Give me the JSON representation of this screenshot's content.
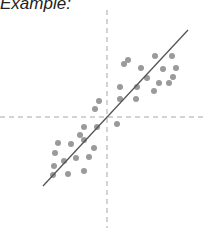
{
  "title": "Example:",
  "chart_data": {
    "type": "scatter",
    "title": "Example:",
    "xlabel": "",
    "ylabel": "",
    "grid": false,
    "legend": null,
    "axes": {
      "style": "dashed",
      "color": "#a6a6a6",
      "origin_px": [
        107,
        117
      ]
    },
    "xlim": [
      -107,
      100
    ],
    "ylim": [
      -111,
      107
    ],
    "points": [
      [
        17,
        53
      ],
      [
        21,
        57
      ],
      [
        48,
        61
      ],
      [
        65,
        61
      ],
      [
        34,
        49
      ],
      [
        56,
        48
      ],
      [
        69,
        49
      ],
      [
        40,
        39
      ],
      [
        66,
        40
      ],
      [
        13,
        30
      ],
      [
        30,
        30
      ],
      [
        52,
        34
      ],
      [
        62,
        34
      ],
      [
        47,
        26
      ],
      [
        13,
        18
      ],
      [
        29,
        18
      ],
      [
        -8,
        16
      ],
      [
        -12,
        8
      ],
      [
        10,
        -7
      ],
      [
        -23,
        -10
      ],
      [
        -10,
        -10
      ],
      [
        -27,
        -18
      ],
      [
        -49,
        -26
      ],
      [
        -36,
        -27
      ],
      [
        -23,
        -23
      ],
      [
        -52,
        -36
      ],
      [
        -13,
        -31
      ],
      [
        -31,
        -41
      ],
      [
        -18,
        -40
      ],
      [
        -43,
        -44
      ],
      [
        -53,
        -49
      ],
      [
        -54,
        -58
      ],
      [
        -39,
        -57
      ],
      [
        -23,
        -54
      ]
    ],
    "point_color": "#9a9a9a",
    "point_radius": 3,
    "trend_line": {
      "from": [
        -64,
        -69
      ],
      "to": [
        81,
        87
      ],
      "color": "#555555"
    }
  }
}
